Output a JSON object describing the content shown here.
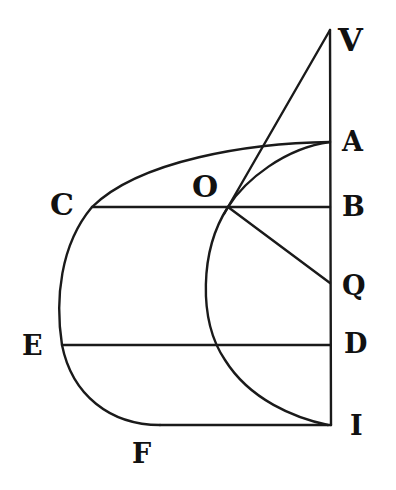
{
  "figure": {
    "labels": {
      "V": "V",
      "A": "A",
      "O": "O",
      "B": "B",
      "C": "C",
      "Q": "Q",
      "E": "E",
      "D": "D",
      "I": "I",
      "F": "F"
    },
    "points": {
      "V": [
        330,
        30
      ],
      "A": [
        330,
        142
      ],
      "B": [
        330,
        207
      ],
      "O": [
        228,
        207
      ],
      "C": [
        92,
        207
      ],
      "Q": [
        330,
        283
      ],
      "E": [
        62,
        345
      ],
      "D": [
        330,
        345
      ],
      "I": [
        330,
        425
      ],
      "F": [
        160,
        425
      ]
    },
    "segments": [
      "VI",
      "VO",
      "CB",
      "OQ",
      "ED",
      "FI"
    ],
    "curves": [
      "outer curve A-C-E-F",
      "inner arc A-O-I"
    ],
    "stroke_color": "#1a1a1a",
    "background": "#ffffff"
  }
}
